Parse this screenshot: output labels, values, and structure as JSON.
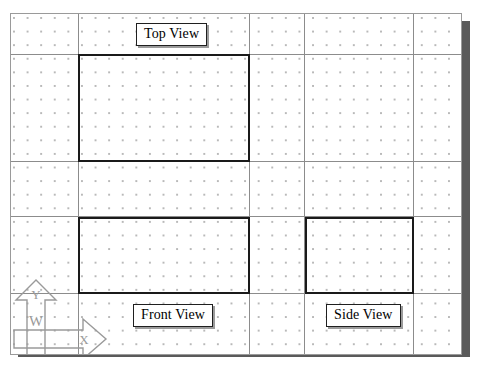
{
  "app": {
    "kind": "cad-orthographic-view-layout",
    "background_color": "#ffffff",
    "sheet_color": "#ffffff",
    "sheet_border_color": "#9a9a9a",
    "shadow_color": "#5a5a5a",
    "grid_dot_color": "#b9b9b9",
    "grid_line_color": "#8c8c8c",
    "drawing_line_color": "#1a1a1a"
  },
  "sheet": {
    "x": 10,
    "y": 13,
    "width": 452,
    "height": 342,
    "shadow_offset_x": 8,
    "shadow_offset_y": 8
  },
  "grid": {
    "dot_spacing": 13.6,
    "major_vertical_x": [
      67,
      238,
      293,
      402
    ],
    "major_horizontal_y": [
      40,
      147,
      202,
      279
    ]
  },
  "views": [
    {
      "id": "top",
      "label": "Top View",
      "rect": {
        "x": 67,
        "y": 40,
        "width": 171,
        "height": 107
      },
      "label_box": {
        "x": 125,
        "y": 22,
        "width": 77,
        "height": 21
      }
    },
    {
      "id": "front",
      "label": "Front View",
      "rect": {
        "x": 67,
        "y": 203,
        "width": 171,
        "height": 77
      },
      "label_box": {
        "x": 122,
        "y": 303,
        "width": 86,
        "height": 21
      }
    },
    {
      "id": "side",
      "label": "Side View",
      "rect": {
        "x": 294,
        "y": 203,
        "width": 108,
        "height": 77
      },
      "label_box": {
        "x": 315,
        "y": 303,
        "width": 83,
        "height": 21
      }
    }
  ],
  "axis_indicators": [
    {
      "id": "y-axis",
      "direction": "up",
      "head_label": "Y",
      "shaft_label": "W",
      "color": "#9a9a9a"
    },
    {
      "id": "x-axis",
      "direction": "right",
      "head_label": "X",
      "shaft_label": "",
      "color": "#9a9a9a"
    }
  ]
}
